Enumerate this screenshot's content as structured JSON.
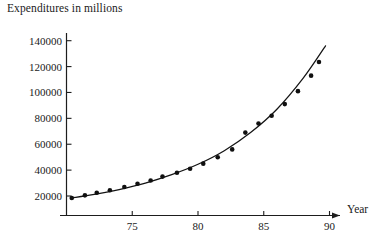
{
  "chart_data": {
    "type": "scatter",
    "title": "Expenditures in millions",
    "xlabel": "Year",
    "ylabel": "Expenditures in millions",
    "grid": false,
    "legend": null,
    "xlim": [
      70,
      90.5
    ],
    "ylim": [
      0,
      148000
    ],
    "xticks": [
      75,
      80,
      85,
      90
    ],
    "yticks": [
      20000,
      40000,
      60000,
      80000,
      100000,
      120000,
      140000
    ],
    "xtick_labels": [
      "75",
      "80",
      "85",
      "90"
    ],
    "ytick_labels": [
      "20000",
      "40000",
      "60000",
      "80000",
      "100000",
      "120000",
      "140000"
    ],
    "x_axis_arrow": true,
    "series": [
      {
        "name": "Expenditures",
        "marker": "filled-circle",
        "x": [
          70.4,
          71.4,
          72.3,
          73.3,
          74.4,
          75.4,
          76.4,
          77.3,
          78.4,
          79.4,
          80.4,
          81.5,
          82.6,
          83.6,
          84.6,
          85.6,
          86.6,
          87.6,
          88.6,
          89.2
        ],
        "y": [
          18500,
          20500,
          22500,
          24500,
          27000,
          29500,
          32000,
          35000,
          38000,
          41000,
          45000,
          50000,
          56000,
          69000,
          76000,
          82000,
          91000,
          101000,
          113000,
          123500
        ]
      },
      {
        "name": "fitted curve",
        "type": "line",
        "x": [
          70.4,
          72,
          74,
          76,
          78,
          80,
          82,
          84,
          86,
          88,
          89.7
        ],
        "y": [
          18500,
          21000,
          25000,
          30000,
          36500,
          44500,
          55000,
          69000,
          87000,
          111000,
          136000
        ]
      }
    ]
  },
  "labels": {
    "y_axis_title": "Expenditures in millions",
    "x_axis_title": "Year"
  }
}
